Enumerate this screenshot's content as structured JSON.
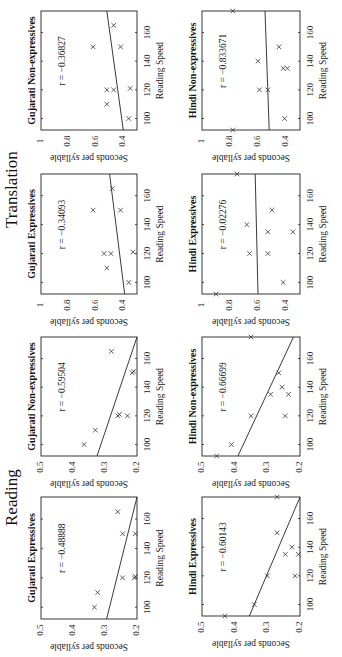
{
  "figure": {
    "section_labels": [
      "Translation",
      "Reading"
    ],
    "common": {
      "xlabel": "Reading Speed",
      "ylabel": "Seconds per syllable",
      "xticks": [
        100,
        120,
        140,
        160
      ],
      "xlim": [
        92,
        175
      ]
    }
  },
  "chart_data": [
    {
      "type": "scatter",
      "section": "Reading",
      "title": "Gujarati Expressives",
      "annotation": "r = −0.48888",
      "xlabel": "Reading Speed",
      "ylabel": "Seconds per syllable",
      "xlim": [
        92,
        175
      ],
      "ylim": [
        0.2,
        0.5
      ],
      "xticks": [
        100,
        120,
        140,
        160
      ],
      "yticks": [
        "0.5",
        "0.4",
        "0.3",
        "0.2"
      ],
      "points": [
        [
          100,
          0.333
        ],
        [
          110,
          0.323
        ],
        [
          120,
          0.245
        ],
        [
          120,
          0.208
        ],
        [
          121,
          0.205
        ],
        [
          150,
          0.245
        ],
        [
          150,
          0.205
        ],
        [
          165,
          0.26
        ]
      ],
      "fit_line": [
        [
          92,
          0.295
        ],
        [
          175,
          0.2
        ]
      ]
    },
    {
      "type": "scatter",
      "section": "Reading",
      "title": "Hindi Expressives",
      "annotation": "r = −0.60143",
      "xlabel": "Reading Speed",
      "ylabel": "Seconds per syllable",
      "xlim": [
        92,
        175
      ],
      "ylim": [
        0.2,
        0.5
      ],
      "xticks": [
        100,
        120,
        140,
        160
      ],
      "yticks": [
        "0.5",
        "0.4",
        "0.3",
        "0.2"
      ],
      "points": [
        [
          92,
          0.43
        ],
        [
          100,
          0.34
        ],
        [
          120,
          0.3
        ],
        [
          120,
          0.215
        ],
        [
          135,
          0.245
        ],
        [
          135,
          0.205
        ],
        [
          140,
          0.225
        ],
        [
          150,
          0.27
        ],
        [
          175,
          0.27
        ]
      ],
      "fit_line": [
        [
          92,
          0.355
        ],
        [
          175,
          0.2
        ]
      ]
    },
    {
      "type": "scatter",
      "section": "Reading",
      "title": "Gujarati Non-expressives",
      "annotation": "r = −0.59504",
      "xlabel": "Reading Speed",
      "ylabel": "Seconds per syllable",
      "xlim": [
        92,
        175
      ],
      "ylim": [
        0.2,
        0.5
      ],
      "xticks": [
        100,
        120,
        140,
        160
      ],
      "yticks": [
        "0.5",
        "0.4",
        "0.3",
        "0.2"
      ],
      "points": [
        [
          100,
          0.365
        ],
        [
          110,
          0.33
        ],
        [
          120,
          0.26
        ],
        [
          121,
          0.255
        ],
        [
          120,
          0.23
        ],
        [
          150,
          0.215
        ],
        [
          151,
          0.21
        ],
        [
          165,
          0.28
        ]
      ],
      "fit_line": [
        [
          92,
          0.325
        ],
        [
          175,
          0.2
        ]
      ]
    },
    {
      "type": "scatter",
      "section": "Reading",
      "title": "Hindi Non-expressives",
      "annotation": "r = −0.66699",
      "xlabel": "Reading Speed",
      "ylabel": "Seconds per syllable",
      "xlim": [
        92,
        175
      ],
      "ylim": [
        0.2,
        0.5
      ],
      "xticks": [
        100,
        120,
        140,
        160
      ],
      "yticks": [
        "0.5",
        "0.4",
        "0.3",
        "0.2"
      ],
      "points": [
        [
          92,
          0.455
        ],
        [
          100,
          0.41
        ],
        [
          120,
          0.35
        ],
        [
          120,
          0.245
        ],
        [
          135,
          0.29
        ],
        [
          135,
          0.235
        ],
        [
          140,
          0.255
        ],
        [
          150,
          0.265
        ],
        [
          175,
          0.35
        ]
      ],
      "fit_line": [
        [
          92,
          0.39
        ],
        [
          175,
          0.22
        ]
      ]
    },
    {
      "type": "scatter",
      "section": "Translation",
      "title": "Gujarati Expressives",
      "annotation": "r = −0.34093",
      "xlabel": "Reading Speed",
      "ylabel": "Seconds per syllable",
      "xlim": [
        92,
        175
      ],
      "ylim": [
        0.3,
        1.0
      ],
      "xticks": [
        100,
        120,
        140,
        160
      ],
      "yticks": [
        "1",
        "0.8",
        "0.6",
        "0.4"
      ],
      "points": [
        [
          100,
          0.36
        ],
        [
          110,
          0.52
        ],
        [
          120,
          0.54
        ],
        [
          120,
          0.49
        ],
        [
          121,
          0.33
        ],
        [
          150,
          0.62
        ],
        [
          150,
          0.42
        ],
        [
          165,
          0.48
        ]
      ],
      "fit_line": [
        [
          92,
          0.39
        ],
        [
          175,
          0.5
        ]
      ]
    },
    {
      "type": "scatter",
      "section": "Translation",
      "title": "Hindi Expressives",
      "annotation": "r = −0.02276",
      "xlabel": "Reading Speed",
      "ylabel": "Seconds per syllable",
      "xlim": [
        92,
        175
      ],
      "ylim": [
        0.3,
        1.0
      ],
      "xticks": [
        100,
        120,
        140,
        160
      ],
      "yticks": [
        "1",
        "0.8",
        "0.6",
        "0.4"
      ],
      "points": [
        [
          92,
          0.9
        ],
        [
          100,
          0.42
        ],
        [
          120,
          0.66
        ],
        [
          120,
          0.53
        ],
        [
          135,
          0.53
        ],
        [
          135,
          0.35
        ],
        [
          140,
          0.68
        ],
        [
          150,
          0.5
        ],
        [
          175,
          0.75
        ]
      ],
      "fit_line": [
        [
          92,
          0.6
        ],
        [
          175,
          0.62
        ]
      ]
    },
    {
      "type": "scatter",
      "section": "Translation",
      "title": "Gujarati Non-expressives",
      "annotation": "r = −0.36827",
      "xlabel": "Reading Speed",
      "ylabel": "Seconds per syllable",
      "xlim": [
        92,
        175
      ],
      "ylim": [
        0.3,
        1.0
      ],
      "xticks": [
        100,
        120,
        140,
        160
      ],
      "yticks": [
        "1",
        "0.8",
        "0.6",
        "0.4"
      ],
      "points": [
        [
          100,
          0.36
        ],
        [
          110,
          0.52
        ],
        [
          120,
          0.52
        ],
        [
          120,
          0.47
        ],
        [
          121,
          0.35
        ],
        [
          150,
          0.62
        ],
        [
          150,
          0.42
        ],
        [
          165,
          0.47
        ]
      ],
      "fit_line": [
        [
          92,
          0.4
        ],
        [
          175,
          0.52
        ]
      ]
    },
    {
      "type": "scatter",
      "section": "Translation",
      "title": "Hindi Non-expressives",
      "annotation": "r = −0.833671",
      "xlabel": "Reading Speed",
      "ylabel": "Seconds per syllable",
      "xlim": [
        92,
        175
      ],
      "ylim": [
        0.3,
        1.0
      ],
      "xticks": [
        100,
        120,
        140,
        160
      ],
      "yticks": [
        "1",
        "0.8",
        "0.6",
        "0.4"
      ],
      "points": [
        [
          92,
          0.78
        ],
        [
          100,
          0.41
        ],
        [
          120,
          0.59
        ],
        [
          120,
          0.53
        ],
        [
          135,
          0.42
        ],
        [
          135,
          0.39
        ],
        [
          140,
          0.6
        ],
        [
          150,
          0.45
        ],
        [
          175,
          0.78
        ]
      ],
      "fit_line": [
        [
          92,
          0.52
        ],
        [
          175,
          0.55
        ]
      ]
    }
  ],
  "layout": {
    "panels": [
      {
        "chart": 0,
        "frame": {
          "x0": 41,
          "x1": 137,
          "y0": 497,
          "y1": 619
        }
      },
      {
        "chart": 1,
        "frame": {
          "x0": 202,
          "x1": 300,
          "y0": 497,
          "y1": 616
        }
      },
      {
        "chart": 2,
        "frame": {
          "x0": 41,
          "x1": 137,
          "y0": 337,
          "y1": 456
        }
      },
      {
        "chart": 3,
        "frame": {
          "x0": 202,
          "x1": 300,
          "y0": 337,
          "y1": 456
        }
      },
      {
        "chart": 4,
        "frame": {
          "x0": 41,
          "x1": 137,
          "y0": 174,
          "y1": 294
        }
      },
      {
        "chart": 5,
        "frame": {
          "x0": 202,
          "x1": 300,
          "y0": 174,
          "y1": 294
        }
      },
      {
        "chart": 6,
        "frame": {
          "x0": 41,
          "x1": 137,
          "y0": 11,
          "y1": 130
        }
      },
      {
        "chart": 7,
        "frame": {
          "x0": 202,
          "x1": 300,
          "y0": 11,
          "y1": 130
        }
      }
    ],
    "section_label_pos": [
      {
        "x": 8,
        "y": 232
      },
      {
        "x": 10,
        "y": 530
      }
    ]
  }
}
